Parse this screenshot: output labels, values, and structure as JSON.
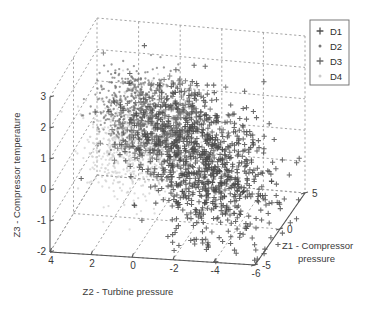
{
  "chart_data": {
    "type": "scatter",
    "title": "",
    "projection": "3d",
    "xlabel": "Z2 - Turbine pressure",
    "ylabel": "Z1 - Compressor pressure",
    "zlabel": "Z3 - Compressor temperature",
    "xticks": [
      "4",
      "2",
      "0",
      "-2",
      "-4",
      "-6"
    ],
    "xlim": [
      4,
      -6
    ],
    "yticks": [
      "-5",
      "0",
      "5"
    ],
    "ylim": [
      -5,
      5
    ],
    "zticks": [
      "3",
      "2",
      "1",
      "0",
      "-1",
      "-2"
    ],
    "zlim": [
      -2,
      3
    ],
    "grid": true,
    "legend_position": "upper-right",
    "legend": [
      {
        "name": "D1",
        "marker": "plus",
        "color": "#4f4f4f",
        "size": 6
      },
      {
        "name": "D2",
        "marker": "dot",
        "color": "#777777",
        "size": 2
      },
      {
        "name": "D3",
        "marker": "plus",
        "color": "#6b6b6b",
        "size": 6
      },
      {
        "name": "D4",
        "marker": "dot",
        "color": "#cacaca",
        "size": 2
      }
    ],
    "series": [
      {
        "name": "D1",
        "marker": "plus",
        "color": "#4a4a4a",
        "n_points": 900,
        "cluster": {
          "cx": 205,
          "cy": 165,
          "sx": 30,
          "sy": 42,
          "rot": -0.72
        }
      },
      {
        "name": "D2",
        "marker": "dot",
        "color": "#707070",
        "n_points": 520,
        "cluster": {
          "cx": 135,
          "cy": 107,
          "sx": 20,
          "sy": 20,
          "rot": -0.5
        }
      },
      {
        "name": "D3",
        "marker": "plus",
        "color": "#6e6e6e",
        "n_points": 330,
        "cluster": {
          "cx": 168,
          "cy": 125,
          "sx": 22,
          "sy": 20,
          "rot": -0.6
        }
      },
      {
        "name": "D4",
        "marker": "dot",
        "color": "#cdcdcd",
        "n_points": 620,
        "cluster": {
          "cx": 133,
          "cy": 148,
          "sx": 22,
          "sy": 24,
          "rot": -0.55
        }
      }
    ]
  },
  "axes": {
    "z_axis_title": "Z3 - Compressor temperature",
    "x_axis_title": "Z2 - Turbine pressure",
    "y_axis_title_line1": "Z1 - Compressor",
    "y_axis_title_line2": "pressure",
    "z_tick_labels": [
      "3",
      "2",
      "1",
      "0",
      "-1",
      "-2"
    ],
    "x_tick_labels": [
      "4",
      "2",
      "0",
      "-2",
      "-4",
      "-6"
    ],
    "y_tick_labels": [
      "-5",
      "0",
      "5"
    ]
  },
  "legend": {
    "items": [
      {
        "label": "D1"
      },
      {
        "label": "D2"
      },
      {
        "label": "D3"
      },
      {
        "label": "D4"
      }
    ]
  }
}
